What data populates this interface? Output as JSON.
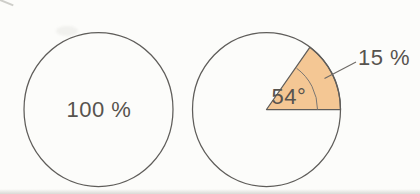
{
  "figure": {
    "kind": "two pie-chart diagrams (textbook illustration)",
    "left_pie_label": "100 %",
    "right_pie_percent_label": "15 %",
    "right_pie_angle_label": "54°"
  },
  "colors": {
    "background": "#FCFCFA",
    "outline": "#5F5D5A",
    "sector_fill": "#F4C794",
    "label_text": "#57534E",
    "leader_line": "#6E6A66"
  },
  "chart_data": [
    {
      "type": "pie",
      "title": "",
      "slices": [
        {
          "label": "100 %",
          "value_percent": 100,
          "fill": "none"
        }
      ]
    },
    {
      "type": "pie",
      "title": "",
      "slices": [
        {
          "label": "15 %",
          "value_percent": 15,
          "central_angle_deg": 54,
          "angle_label": "54°",
          "fill": "#F4C794"
        },
        {
          "label": "",
          "value_percent": 85,
          "fill": "none"
        }
      ]
    }
  ]
}
